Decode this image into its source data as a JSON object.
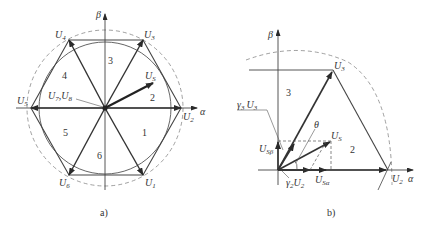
{
  "figure_a": {
    "caption": "a)",
    "axes": {
      "alpha": "α",
      "beta": "β"
    },
    "vectors": [
      {
        "id": "U1",
        "label": "U",
        "sub": "1"
      },
      {
        "id": "U2",
        "label": "U",
        "sub": "2"
      },
      {
        "id": "U3",
        "label": "U",
        "sub": "3"
      },
      {
        "id": "U4",
        "label": "U",
        "sub": "4"
      },
      {
        "id": "U5",
        "label": "U",
        "sub": "5"
      },
      {
        "id": "U6",
        "label": "U",
        "sub": "6"
      }
    ],
    "reference_vector": {
      "label": "U",
      "sub": "S"
    },
    "zero_vectors": {
      "label1": "U",
      "sub1": "7",
      "sep": ",",
      "label2": "U",
      "sub2": "8"
    },
    "sectors": [
      "1",
      "2",
      "3",
      "4",
      "5",
      "6"
    ]
  },
  "figure_b": {
    "caption": "b)",
    "axes": {
      "alpha": "α",
      "beta": "β"
    },
    "labels": {
      "u3": {
        "label": "U",
        "sub": "3"
      },
      "u2": {
        "label": "U",
        "sub": "2"
      },
      "us": {
        "label": "U",
        "sub": "S"
      },
      "gamma3u3": {
        "g": "γ",
        "gsub": "3",
        "label": "U",
        "sub": "3"
      },
      "gamma2u2": {
        "g": "γ",
        "gsub": "2",
        "label": "U",
        "sub": "2"
      },
      "usbeta": {
        "label": "U",
        "sub": "Sβ"
      },
      "usalpha": {
        "label": "U",
        "sub": "Sα"
      },
      "theta": "θ"
    },
    "sectors": [
      "3",
      "2"
    ]
  }
}
